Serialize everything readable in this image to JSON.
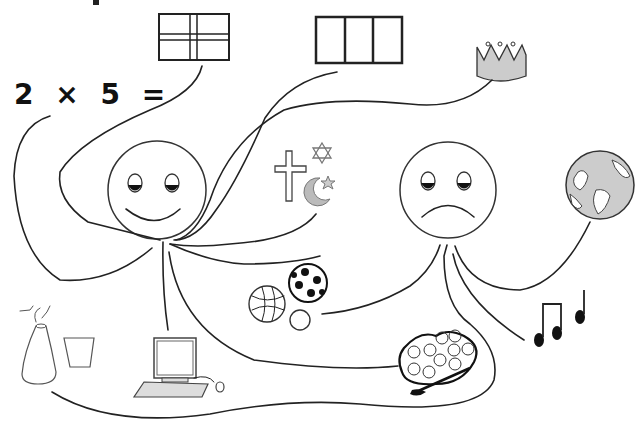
{
  "diagram": {
    "equation": "2 × 5 =",
    "colors": {
      "ink": "#222222",
      "fill_gray": "#cccccc",
      "background": "#ffffff"
    },
    "faces": [
      {
        "name": "happy-face",
        "expression": "smile"
      },
      {
        "name": "sad-face",
        "expression": "frown"
      }
    ],
    "items": [
      {
        "name": "flag-cross",
        "description": "flag with cross"
      },
      {
        "name": "flag-three-panel",
        "description": "three-panel flag"
      },
      {
        "name": "crown",
        "description": "crown"
      },
      {
        "name": "religious-symbols",
        "description": "cross, star of David, crescent and star"
      },
      {
        "name": "globe",
        "description": "globe"
      },
      {
        "name": "sports-balls",
        "description": "basketball, soccer ball, small ball"
      },
      {
        "name": "music-notes",
        "description": "music notes"
      },
      {
        "name": "paint-palette",
        "description": "paint palette and brush"
      },
      {
        "name": "computer",
        "description": "computer with keyboard and mouse"
      },
      {
        "name": "science-flask",
        "description": "flask and beaker"
      }
    ]
  }
}
